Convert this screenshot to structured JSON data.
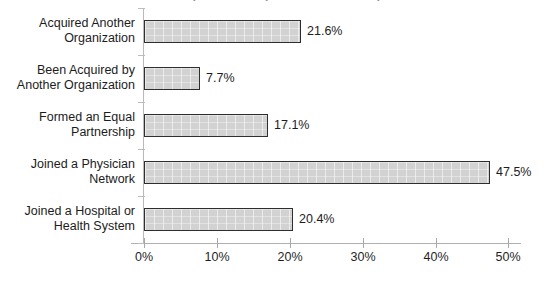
{
  "chart_data": {
    "type": "bar",
    "orientation": "horizontal",
    "title": "Hospital and Physician Relationships",
    "categories": [
      "Acquired Another Organization",
      "Been Acquired by Another Organization",
      "Formed an Equal Partnership",
      "Joined a Physician Network",
      "Joined a Hospital or Health System"
    ],
    "category_lines": [
      [
        "Acquired Another",
        "Organization"
      ],
      [
        "Been Acquired by",
        "Another Organization"
      ],
      [
        "Formed an Equal",
        "Partnership"
      ],
      [
        "Joined a Physician",
        "Network"
      ],
      [
        "Joined a Hospital or",
        "Health System"
      ]
    ],
    "values": [
      21.6,
      7.7,
      17.1,
      47.5,
      20.4
    ],
    "value_labels": [
      "21.6%",
      "7.7%",
      "17.1%",
      "47.5%",
      "20.4%"
    ],
    "xlabel": "",
    "ylabel": "",
    "xlim": [
      0,
      50
    ],
    "xticks": [
      0,
      10,
      20,
      30,
      40,
      50
    ],
    "xtick_labels": [
      "0%",
      "10%",
      "20%",
      "30%",
      "40%",
      "50%"
    ],
    "grid": false,
    "legend": false,
    "bar_fill_color": "#d2d2d2",
    "bar_border_color": "#2e2e2e",
    "background_color": "#ffffff",
    "axis_color": "#b0b0b0",
    "text_color": "#1c1c1c"
  }
}
